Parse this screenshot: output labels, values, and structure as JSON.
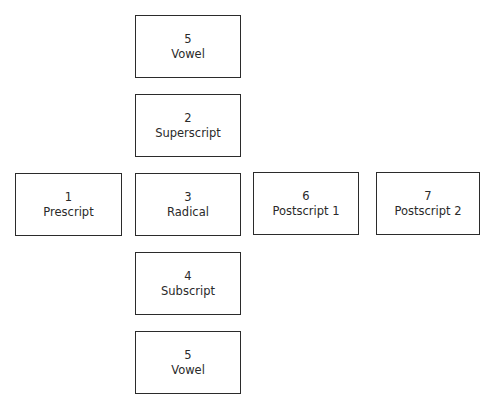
{
  "diagram": {
    "title": "",
    "boxes": [
      {
        "id": "vowel-top",
        "number": "5",
        "label": "Vowel",
        "x": 135,
        "y": 15,
        "w": 106,
        "h": 63
      },
      {
        "id": "superscript",
        "number": "2",
        "label": "Superscript",
        "x": 135,
        "y": 94,
        "w": 106,
        "h": 63
      },
      {
        "id": "prescript",
        "number": "1",
        "label": "Prescript",
        "x": 15,
        "y": 173,
        "w": 107,
        "h": 63
      },
      {
        "id": "radical",
        "number": "3",
        "label": "Radical",
        "x": 135,
        "y": 173,
        "w": 106,
        "h": 63
      },
      {
        "id": "postscript-1",
        "number": "6",
        "label": "Postscript 1",
        "x": 253,
        "y": 172,
        "w": 106,
        "h": 63
      },
      {
        "id": "postscript-2",
        "number": "7",
        "label": "Postscript 2",
        "x": 376,
        "y": 172,
        "w": 104,
        "h": 63
      },
      {
        "id": "subscript",
        "number": "4",
        "label": "Subscript",
        "x": 135,
        "y": 252,
        "w": 106,
        "h": 63
      },
      {
        "id": "vowel-bottom",
        "number": "5",
        "label": "Vowel",
        "x": 135,
        "y": 331,
        "w": 106,
        "h": 63
      }
    ]
  }
}
